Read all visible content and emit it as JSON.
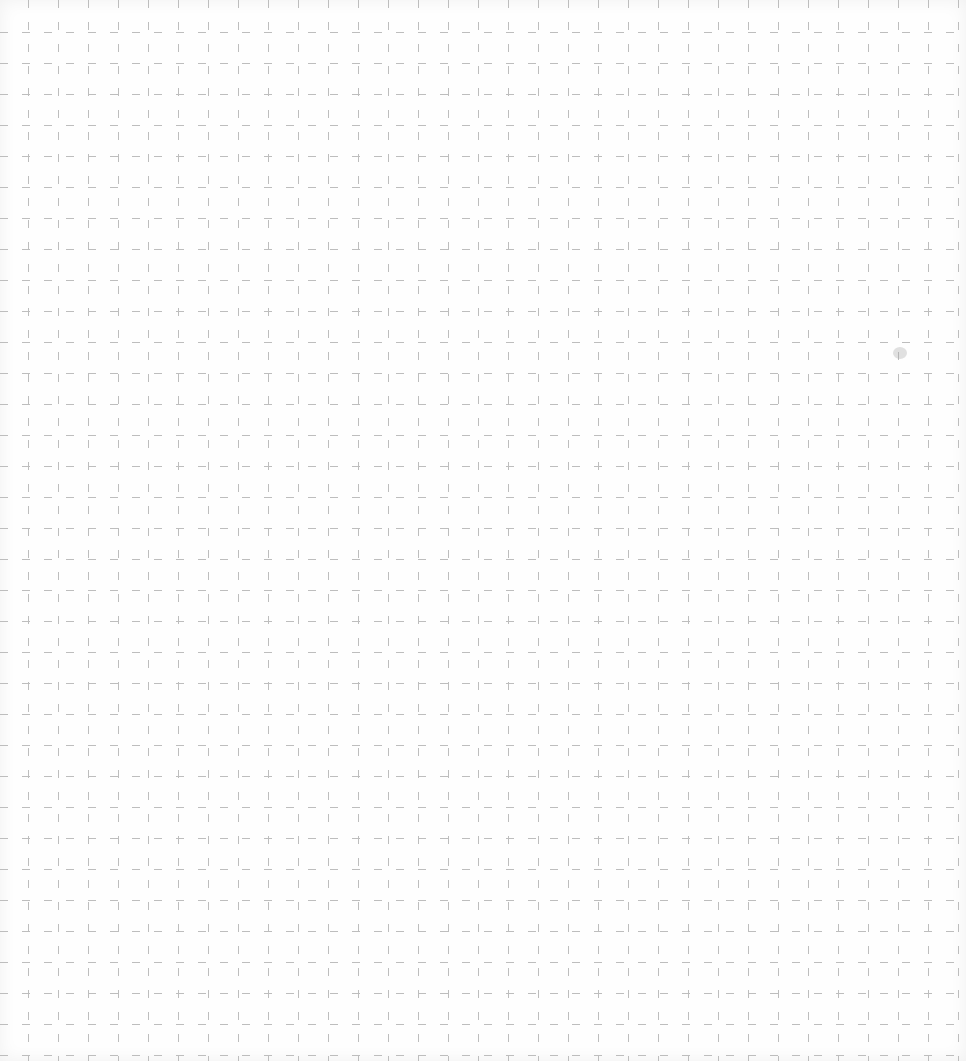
{
  "paper": {
    "type": "dashed-grid",
    "grid_spacing_x": 30,
    "grid_spacing_y": 31,
    "offset_x": 28,
    "offset_y": 32,
    "line_color": "#bdbdbd",
    "background_color": "#fefefe"
  }
}
